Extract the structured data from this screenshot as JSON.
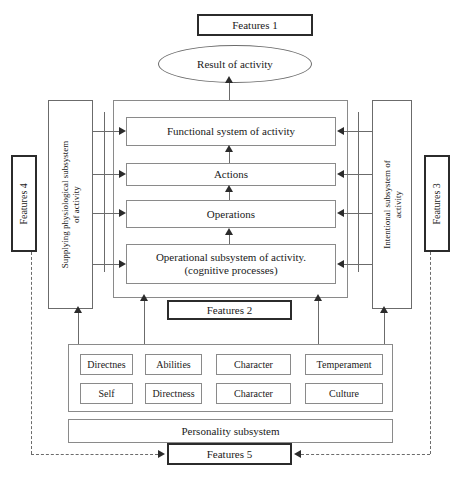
{
  "diagram": {
    "title_top": "Features 1",
    "result_node": "Result of activity",
    "center_stack": [
      "Functional system of activity",
      "Actions",
      "Operations",
      "Operational subsystem of activity.\n(cognitive processes)"
    ],
    "center_stack_line1": "Operational subsystem of activity.",
    "center_stack_line2": "(cognitive processes)",
    "left_subsystem_line1": "Supplying physiological subsystem",
    "left_subsystem_line2": "of activity",
    "right_subsystem_line1": "Intentional subsystem of",
    "right_subsystem_line2": "activity",
    "features_left": "Features 4",
    "features_right": "Features 3",
    "features_center": "Features 2",
    "features_bottom": "Features 5",
    "personality_subsystem": "Personality subsystem",
    "traits_row_1": [
      "Directnes",
      "Abilities",
      "Character",
      "Temperament"
    ],
    "traits_row_2": [
      "Self",
      "Directness",
      "Character",
      "Culture"
    ]
  },
  "colors": {
    "line": "#6b6b6b",
    "thick_line": "#2b2b2b",
    "background": "#ffffff",
    "text": "#1a1a1a"
  }
}
